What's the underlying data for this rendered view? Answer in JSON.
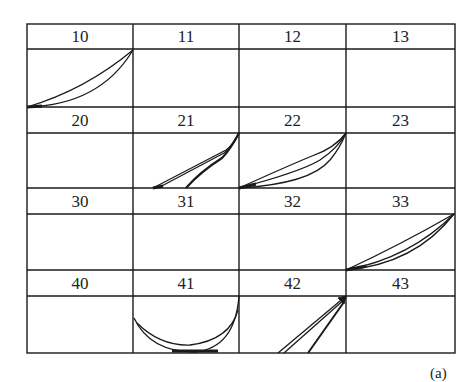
{
  "figure": {
    "caption": "(a)",
    "grid": {
      "rows": 4,
      "cols": 4,
      "cells": [
        {
          "label": "10",
          "curves": "two-curves-bottom-left-to-top-right"
        },
        {
          "label": "11",
          "curves": "none"
        },
        {
          "label": "12",
          "curves": "none"
        },
        {
          "label": "13",
          "curves": "none"
        },
        {
          "label": "20",
          "curves": "none"
        },
        {
          "label": "21",
          "curves": "three-curves-from-top-right-fanning-to-bottom"
        },
        {
          "label": "22",
          "curves": "three-curves-bottom-left-to-top-right"
        },
        {
          "label": "23",
          "curves": "none"
        },
        {
          "label": "30",
          "curves": "none"
        },
        {
          "label": "31",
          "curves": "none"
        },
        {
          "label": "32",
          "curves": "none"
        },
        {
          "label": "33",
          "curves": "three-curves-bottom-left-to-top-right"
        },
        {
          "label": "40",
          "curves": "none"
        },
        {
          "label": "41",
          "curves": "two-u-shaped-arcs"
        },
        {
          "label": "42",
          "curves": "three-lines-from-top-right-fanning-to-bottom"
        },
        {
          "label": "43",
          "curves": "none"
        }
      ]
    },
    "colors": {
      "line": "#1a1a1a",
      "background": "#ffffff"
    }
  }
}
